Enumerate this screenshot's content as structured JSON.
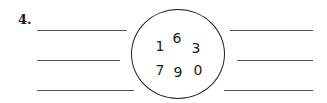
{
  "problem": {
    "number_label": "4.",
    "digits": [
      {
        "value": "1",
        "x": 160,
        "y": 46
      },
      {
        "value": "6",
        "x": 177,
        "y": 38
      },
      {
        "value": "3",
        "x": 196,
        "y": 48
      },
      {
        "value": "7",
        "x": 160,
        "y": 70
      },
      {
        "value": "9",
        "x": 178,
        "y": 72
      },
      {
        "value": "0",
        "x": 198,
        "y": 70
      }
    ],
    "answer_lines": {
      "left": 3,
      "right": 3
    }
  }
}
